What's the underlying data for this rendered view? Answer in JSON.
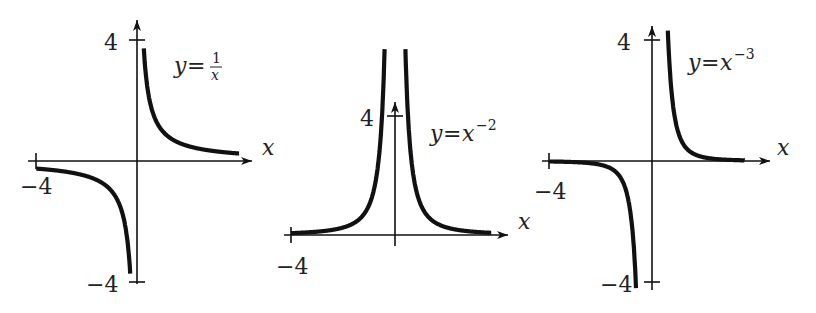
{
  "chart_data": [
    {
      "type": "line",
      "title": "y = 1/x",
      "label": {
        "lhs": "y",
        "eq": "=",
        "num": "1",
        "den": "x"
      },
      "xlabel": "x",
      "ylabel": "",
      "xlim": [
        -4,
        4
      ],
      "ylim": [
        -4,
        4
      ],
      "tick_labels": {
        "x_left": "−4",
        "y_top": "4",
        "y_bottom": "−4"
      },
      "function": "reciprocal",
      "series": [
        {
          "name": "x<0",
          "x": [
            -4,
            -3,
            -2,
            -1,
            -0.5,
            -0.25
          ],
          "y": [
            -0.25,
            -0.333,
            -0.5,
            -1,
            -2,
            -4
          ]
        },
        {
          "name": "x>0",
          "x": [
            0.25,
            0.5,
            1,
            2,
            3,
            4
          ],
          "y": [
            4,
            2,
            1,
            0.5,
            0.333,
            0.25
          ]
        }
      ],
      "grid": false
    },
    {
      "type": "line",
      "title": "y = x^-2",
      "label": {
        "lhs": "y",
        "eq": "=",
        "base": "x",
        "exp": "−2"
      },
      "xlabel": "x",
      "ylabel": "",
      "xlim": [
        -4,
        4
      ],
      "ylim": [
        0,
        4
      ],
      "tick_labels": {
        "x_left": "−4",
        "y_top": "4"
      },
      "function": "inverse_square",
      "series": [
        {
          "name": "x<0",
          "x": [
            -4,
            -3,
            -2,
            -1,
            -0.5,
            -0.4
          ],
          "y": [
            0.0625,
            0.111,
            0.25,
            1,
            4,
            6.25
          ]
        },
        {
          "name": "x>0",
          "x": [
            0.4,
            0.5,
            1,
            2,
            3,
            4
          ],
          "y": [
            6.25,
            4,
            1,
            0.25,
            0.111,
            0.0625
          ]
        }
      ],
      "grid": false
    },
    {
      "type": "line",
      "title": "y = x^-3",
      "label": {
        "lhs": "y",
        "eq": "=",
        "base": "x",
        "exp": "−3"
      },
      "xlabel": "x",
      "ylabel": "",
      "xlim": [
        -4,
        4
      ],
      "ylim": [
        -4,
        4
      ],
      "tick_labels": {
        "x_left": "−4",
        "y_top": "4",
        "y_bottom": "−4"
      },
      "function": "inverse_cube",
      "series": [
        {
          "name": "x<0",
          "x": [
            -4,
            -3,
            -2,
            -1,
            -0.63
          ],
          "y": [
            -0.0156,
            -0.037,
            -0.125,
            -1,
            -4
          ]
        },
        {
          "name": "x>0",
          "x": [
            0.6,
            1,
            2,
            3,
            4
          ],
          "y": [
            4.6,
            1,
            0.125,
            0.037,
            0.0156
          ]
        }
      ],
      "grid": false
    }
  ],
  "panels": [
    {
      "ox": 137,
      "oy": 161,
      "sx": 25.2,
      "sy": 30.3,
      "xmin": -4,
      "xmax": 4.05,
      "arrow_x": 252,
      "yaxis_top": 20,
      "yaxis_bottom": 284,
      "ticks_y": [
        4,
        -4
      ],
      "yfn": "1/x",
      "clipTop": 40,
      "clipBottom": 282,
      "split": 0.25
    },
    {
      "ox": 395,
      "oy": 235,
      "sx": 26,
      "sy": 29.75,
      "xmin": -4,
      "xmax": 3.7,
      "arrow_x": 508,
      "yaxis_top": 100,
      "yaxis_bottom": 246,
      "ticks_y": [
        4
      ],
      "yfn": "x^-2",
      "clipTop": 47,
      "clipBottom": 240,
      "split": 0.4
    },
    {
      "ox": 652,
      "oy": 161,
      "sx": 25.75,
      "sy": 30.3,
      "xmin": -4,
      "xmax": 3.6,
      "arrow_x": 770,
      "yaxis_top": 26,
      "yaxis_bottom": 290,
      "ticks_y": [
        4,
        -4
      ],
      "yfn": "x^-3",
      "clipTop": 22,
      "clipBottom": 300,
      "split": 0.6
    }
  ]
}
